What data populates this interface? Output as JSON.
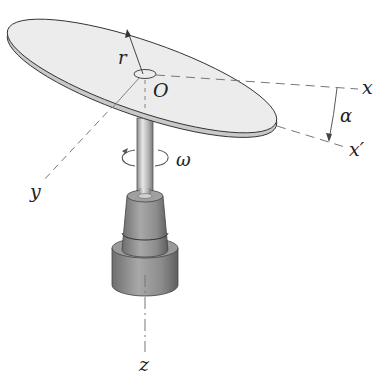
{
  "figure": {
    "type": "engineering-diagram",
    "labels": {
      "radius": "r",
      "origin": "O",
      "x_axis": "x",
      "x_prime_axis": "x′",
      "y_axis": "y",
      "z_axis": "z",
      "tilt_angle": "α",
      "angular_velocity": "ω"
    },
    "colors": {
      "disk_face": "#ececec",
      "disk_rim": "#cfcfcf",
      "outline": "#333333",
      "shaft": "#bdbdbd",
      "base": "#8a8a8a",
      "dash": "#777777"
    }
  }
}
